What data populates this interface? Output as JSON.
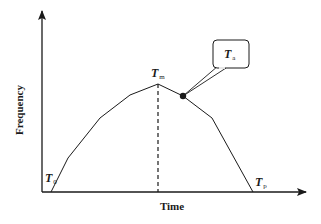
{
  "diagram": {
    "type": "frequency-time curve",
    "axes": {
      "x_label": "Time",
      "y_label": "Frequency"
    },
    "annotations": {
      "t0": {
        "main": "T",
        "sub": "0"
      },
      "tm": {
        "main": "T",
        "sub": "m"
      },
      "tp": {
        "main": "T",
        "sub": "p"
      },
      "ta": {
        "main": "T",
        "sub": "a"
      }
    },
    "curve_points": [
      [
        51,
        192
      ],
      [
        68,
        158
      ],
      [
        100,
        118
      ],
      [
        130,
        95
      ],
      [
        158,
        84
      ],
      [
        183,
        96
      ],
      [
        212,
        118
      ],
      [
        253,
        192
      ]
    ],
    "peak_marker": {
      "x": 158,
      "label": "T_m",
      "style": "dashed vertical line"
    },
    "callout": {
      "target_point": [
        183,
        96
      ],
      "label": "T_a"
    },
    "colors": {
      "line": "#1a1a1a",
      "background": "#ffffff"
    }
  }
}
